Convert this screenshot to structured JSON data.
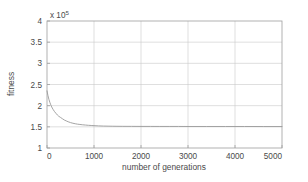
{
  "chart_data": {
    "type": "line",
    "title": "",
    "xlabel": "number of generations",
    "ylabel": "fitness",
    "y_multiplier": "x 10",
    "y_multiplier_exponent": "5",
    "xlim": [
      0,
      5000
    ],
    "ylim": [
      1,
      4
    ],
    "y_scale_factor": 100000,
    "xticks": [
      0,
      1000,
      2000,
      3000,
      4000,
      5000
    ],
    "xtick_labels": [
      "0",
      "1000",
      "2000",
      "3000",
      "4000",
      "5000"
    ],
    "yticks": [
      1,
      1.5,
      2,
      2.5,
      3,
      3.5,
      4
    ],
    "ytick_labels": [
      "1",
      "1.5",
      "2",
      "2.5",
      "3",
      "3.5",
      "4"
    ],
    "grid": true,
    "legend": false,
    "series": [
      {
        "name": "best fitness",
        "color": "#9a9a9a",
        "x": [
          0,
          20,
          40,
          60,
          80,
          100,
          130,
          160,
          190,
          220,
          250,
          290,
          330,
          370,
          410,
          450,
          500,
          550,
          600,
          650,
          700,
          760,
          820,
          880,
          940,
          1000,
          1100,
          1200,
          1400,
          1600,
          1800,
          2000,
          2200,
          2400,
          2600,
          2800,
          3000,
          3400,
          3800,
          4200,
          4600,
          5000
        ],
        "y": [
          2.35,
          2.24,
          2.15,
          2.08,
          2.02,
          1.97,
          1.91,
          1.86,
          1.82,
          1.78,
          1.75,
          1.72,
          1.69,
          1.66,
          1.64,
          1.62,
          1.6,
          1.585,
          1.573,
          1.563,
          1.556,
          1.548,
          1.542,
          1.536,
          1.532,
          1.528,
          1.522,
          1.518,
          1.514,
          1.512,
          1.511,
          1.51,
          1.51,
          1.509,
          1.509,
          1.509,
          1.508,
          1.508,
          1.508,
          1.508,
          1.507,
          1.507
        ]
      }
    ]
  },
  "style": {
    "axis_color": "#9e9e9e",
    "grid_color": "#c9c9c9",
    "curve_color": "#9a9a9a",
    "background": "#ffffff",
    "text_color": "#4a4a4a"
  },
  "layout": {
    "plot_left": 47,
    "plot_right": 282,
    "plot_top": 21,
    "plot_bottom": 148
  }
}
